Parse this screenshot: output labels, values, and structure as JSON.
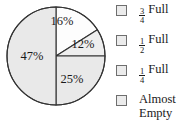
{
  "chart_data": {
    "type": "pie",
    "title": "",
    "categories": [
      "3/4 Full",
      "1/2 Full",
      "1/4 Full",
      "Almost Empty"
    ],
    "values": [
      16,
      12,
      25,
      47
    ],
    "value_labels": [
      "16%",
      "12%",
      "25%",
      "47%"
    ],
    "units": "percent",
    "legend_position": "right",
    "grid": false,
    "slices": [
      {
        "label": "16%",
        "value": 16,
        "legend": "3/4 Full",
        "start_angle_deg": 0,
        "end_angle_deg": 57.6,
        "fill": "#fdfdfd",
        "stroke": "#333333",
        "label_x": 62,
        "label_y": 22
      },
      {
        "label": "12%",
        "value": 12,
        "legend": "1/2 Full",
        "start_angle_deg": 57.6,
        "end_angle_deg": 90,
        "fill": "#eeeeee",
        "stroke": "#333333",
        "label_x": 83,
        "label_y": 45
      },
      {
        "label": "25%",
        "value": 25,
        "legend": "1/4 Full",
        "start_angle_deg": 90,
        "end_angle_deg": 180,
        "fill": "#e9e9e9",
        "stroke": "#333333",
        "label_x": 72,
        "label_y": 80
      },
      {
        "label": "47%",
        "value": 47,
        "legend": "Almost Empty",
        "start_angle_deg": 180,
        "end_angle_deg": 360,
        "fill": "#e9e9e9",
        "stroke": "#333333",
        "label_x": 32,
        "label_y": 57
      }
    ],
    "center_x": 56,
    "center_y": 56,
    "radius": 49,
    "outline_color": "#333333",
    "background": "#ffffff"
  },
  "legend": {
    "items": [
      {
        "checkbox": "unchecked",
        "numerator": "3",
        "denominator": "4",
        "word": "Full",
        "full_label": "3/4 Full"
      },
      {
        "checkbox": "unchecked",
        "numerator": "1",
        "denominator": "2",
        "word": "Full",
        "full_label": "1/2 Full"
      },
      {
        "checkbox": "unchecked",
        "numerator": "1",
        "denominator": "4",
        "word": "Full",
        "full_label": "1/4 Full"
      },
      {
        "checkbox": "unchecked",
        "line1": "Almost",
        "line2": "Empty",
        "full_label": "Almost Empty"
      }
    ],
    "box_fill": "#ebebeb",
    "box_border": "#6e6e6e"
  }
}
